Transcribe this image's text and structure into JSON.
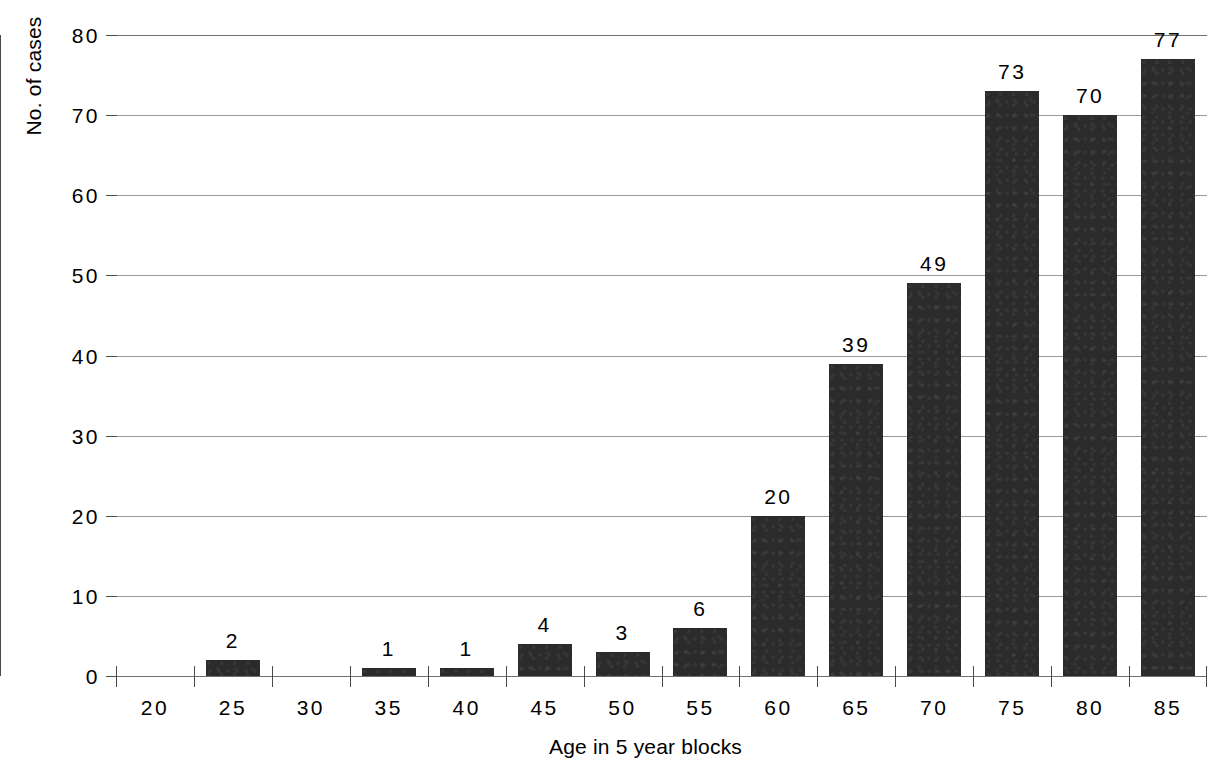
{
  "chart_data": {
    "type": "bar",
    "title": "",
    "xlabel": "Age in 5 year blocks",
    "ylabel": "No. of cases",
    "categories": [
      "20",
      "25",
      "30",
      "35",
      "40",
      "45",
      "50",
      "55",
      "60",
      "65",
      "70",
      "75",
      "80",
      "85"
    ],
    "values": [
      0,
      2,
      0,
      1,
      1,
      4,
      3,
      6,
      20,
      39,
      49,
      73,
      70,
      77
    ],
    "value_labels": [
      "",
      "2",
      "",
      "1",
      "1",
      "4",
      "3",
      "6",
      "20",
      "39",
      "49",
      "73",
      "70",
      "77"
    ],
    "ylim": [
      0,
      80
    ],
    "yticks": [
      0,
      10,
      20,
      30,
      40,
      50,
      60,
      70,
      80
    ],
    "ytick_labels": [
      "0",
      "10",
      "20",
      "30",
      "40",
      "50",
      "60",
      "70",
      "80"
    ],
    "grid": true,
    "legend": false,
    "bar_color": "#2b2b2b",
    "gridline_color": "#9a9a9a",
    "axis_color": "#4a4a4a",
    "background_color": "#ffffff"
  }
}
